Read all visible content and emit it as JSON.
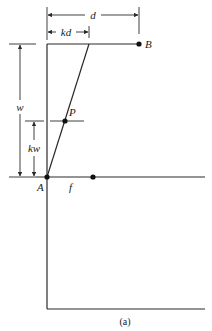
{
  "figure": {
    "caption": "(a)",
    "labels": {
      "d": "d",
      "kd": "kd",
      "B": "B",
      "w": "w",
      "kw": "kw",
      "P": "P",
      "A": "A",
      "f": "f"
    },
    "points": [
      {
        "name": "A",
        "x": 47,
        "y": 177
      },
      {
        "name": "B",
        "x": 139,
        "y": 44
      },
      {
        "name": "P",
        "x": 65,
        "y": 121
      },
      {
        "name": "f-point",
        "x": 93,
        "y": 177
      }
    ],
    "dimensions": [
      {
        "name": "d",
        "from_x": 47,
        "to_x": 139,
        "y": 15
      },
      {
        "name": "kd",
        "from_x": 47,
        "to_x": 89,
        "y": 32
      },
      {
        "name": "w",
        "x": 20,
        "from_y": 44,
        "to_y": 177
      },
      {
        "name": "kw",
        "x": 34,
        "from_y": 121,
        "to_y": 177
      }
    ],
    "colors": {
      "line": "#2a2a2a",
      "background": "#ffffff"
    }
  }
}
